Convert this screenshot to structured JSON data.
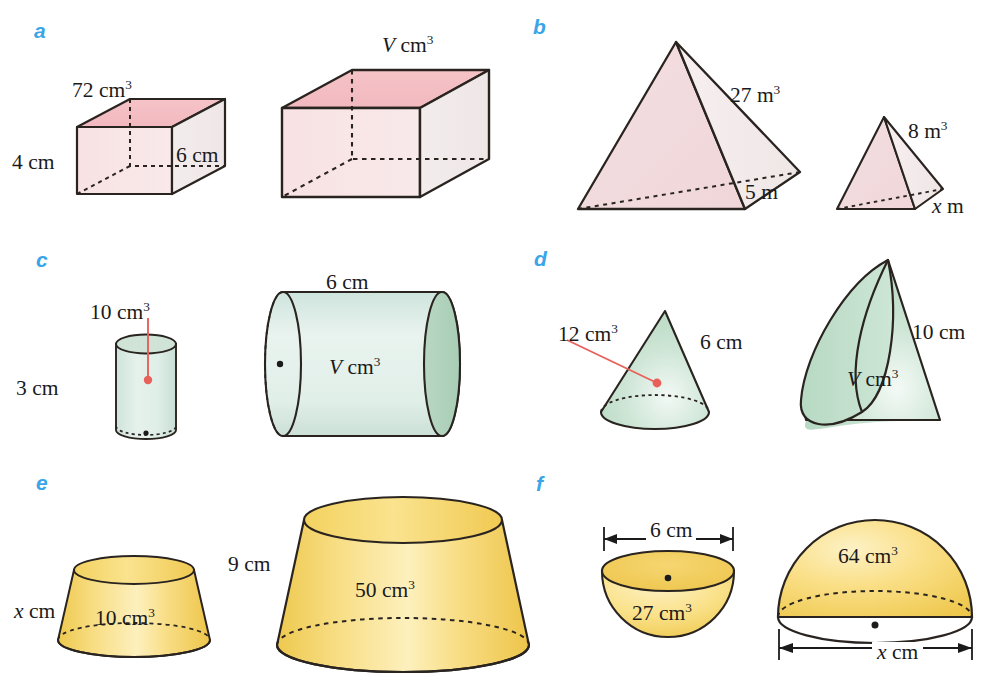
{
  "page": {
    "background": "#ffffff",
    "label_color": "#3aa5e8"
  },
  "palette": {
    "pink_top": "#f4c2c6",
    "pink_front": "#f7dfe1",
    "pink_side": "#f3eaea",
    "green_light": "#d9ebe3",
    "green_mid": "#bcdcc6",
    "green_dark": "#a8cfb4",
    "yellow_light": "#fbe9a8",
    "yellow_mid": "#f8d86a",
    "yellow_dark": "#eec64b",
    "outline": "#2a2420",
    "leader_red": "#e8605a"
  },
  "panels": [
    {
      "id": "a",
      "letter": "a",
      "shape": "cuboid-pair",
      "labels": [
        {
          "name": "small-cuboid-volume",
          "text": "72 cm",
          "sup": "3",
          "x": 72,
          "y": 80
        },
        {
          "name": "small-cuboid-height",
          "text": "4 cm",
          "sup": "",
          "x": 12,
          "y": 152
        },
        {
          "name": "large-cuboid-volume",
          "text": "V cm",
          "sup": "3",
          "italic_first": true,
          "x": 382,
          "y": 35
        },
        {
          "name": "large-cuboid-height",
          "text": "6 cm",
          "sup": "",
          "x": 176,
          "y": 145
        }
      ]
    },
    {
      "id": "b",
      "letter": "b",
      "shape": "pyramid-pair",
      "labels": [
        {
          "name": "large-pyramid-volume",
          "text": "27 m",
          "sup": "3",
          "x": 730,
          "y": 85
        },
        {
          "name": "large-pyramid-edge",
          "text": "5 m",
          "sup": "",
          "x": 745,
          "y": 182
        },
        {
          "name": "small-pyramid-volume",
          "text": "8 m",
          "sup": "3",
          "x": 908,
          "y": 121
        },
        {
          "name": "small-pyramid-edge",
          "text": "x m",
          "sup": "",
          "italic_first": true,
          "x": 932,
          "y": 196
        }
      ]
    },
    {
      "id": "c",
      "letter": "c",
      "shape": "cylinder-pair",
      "labels": [
        {
          "name": "small-cylinder-volume",
          "text": "10 cm",
          "sup": "3",
          "x": 90,
          "y": 302
        },
        {
          "name": "small-cylinder-height",
          "text": "3 cm",
          "sup": "",
          "x": 16,
          "y": 378
        },
        {
          "name": "large-cylinder-length",
          "text": "6 cm",
          "sup": "",
          "x": 326,
          "y": 272
        },
        {
          "name": "large-cylinder-volume",
          "text": "V cm",
          "sup": "3",
          "italic_first": true,
          "x": 329,
          "y": 357
        }
      ]
    },
    {
      "id": "d",
      "letter": "d",
      "shape": "cone-pair",
      "labels": [
        {
          "name": "small-cone-volume",
          "text": "12 cm",
          "sup": "3",
          "x": 558,
          "y": 324
        },
        {
          "name": "small-cone-slant",
          "text": "6 cm",
          "sup": "",
          "x": 700,
          "y": 332
        },
        {
          "name": "large-cone-slant",
          "text": "10 cm",
          "sup": "",
          "x": 912,
          "y": 322
        },
        {
          "name": "large-cone-volume",
          "text": "V cm",
          "sup": "3",
          "italic_first": true,
          "x": 847,
          "y": 369
        }
      ]
    },
    {
      "id": "e",
      "letter": "e",
      "shape": "frustum-pair",
      "labels": [
        {
          "name": "small-frustum-slant",
          "text": "x cm",
          "sup": "",
          "italic_first": true,
          "x": 14,
          "y": 601
        },
        {
          "name": "small-frustum-volume",
          "text": "10 cm",
          "sup": "3",
          "x": 95,
          "y": 608
        },
        {
          "name": "large-frustum-height",
          "text": "9 cm",
          "sup": "",
          "x": 228,
          "y": 554
        },
        {
          "name": "large-frustum-volume",
          "text": "50 cm",
          "sup": "3",
          "x": 355,
          "y": 580
        }
      ]
    },
    {
      "id": "f",
      "letter": "f",
      "shape": "hemisphere-pair",
      "labels": [
        {
          "name": "small-hemisphere-diameter",
          "text": "6 cm",
          "sup": "",
          "x": 646,
          "y": 520
        },
        {
          "name": "small-hemisphere-volume",
          "text": "27 cm",
          "sup": "3",
          "x": 632,
          "y": 603
        },
        {
          "name": "large-hemisphere-volume",
          "text": "64 cm",
          "sup": "3",
          "x": 838,
          "y": 546
        },
        {
          "name": "large-hemisphere-diameter",
          "text": "x cm",
          "sup": "",
          "italic_first": true,
          "x": 872,
          "y": 642
        }
      ]
    }
  ]
}
